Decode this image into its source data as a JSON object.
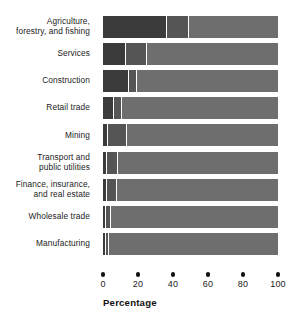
{
  "chart_data": {
    "type": "bar",
    "orientation": "horizontal",
    "stacked": true,
    "title": "",
    "xlabel": "Percentage",
    "ylabel": "",
    "xlim": [
      0,
      100
    ],
    "xticks": [
      0,
      20,
      40,
      60,
      80,
      100
    ],
    "xtick_labels": [
      "0",
      "20",
      "40",
      "60",
      "80",
      "100"
    ],
    "grid": false,
    "legend": "none",
    "categories": [
      "Agriculture, forestry, and fishing",
      "Services",
      "Construction",
      "Retail trade",
      "Mining",
      "Transport and public utilities",
      "Finance, insurance, and real estate",
      "Wholesale trade",
      "Manufacturing"
    ],
    "category_lines": [
      [
        "Agriculture,",
        "forestry, and fishing"
      ],
      [
        "Services"
      ],
      [
        "Construction"
      ],
      [
        "Retail trade"
      ],
      [
        "Mining"
      ],
      [
        "Transport and",
        "public utilities"
      ],
      [
        "Finance, insurance,",
        "and real estate"
      ],
      [
        "Wholesale trade"
      ],
      [
        "Manufacturing"
      ]
    ],
    "series": [
      {
        "name": "segment-1",
        "color": "#3b3b3b",
        "values": [
          36,
          12.5,
          14.5,
          5.7,
          2.0,
          1.6,
          1.6,
          1.3,
          1.0
        ]
      },
      {
        "name": "segment-2",
        "color": "#555555",
        "values": [
          12,
          11.5,
          3.5,
          4.0,
          10.5,
          5.9,
          5.4,
          2.2,
          1.0
        ]
      },
      {
        "name": "segment-3",
        "color": "#6e6e6e",
        "values": [
          52,
          76,
          82,
          90.3,
          87.5,
          92.5,
          93,
          96.5,
          98
        ]
      }
    ],
    "colors": {
      "segment_1": "#3b3b3b",
      "segment_2": "#555555",
      "segment_3": "#6e6e6e",
      "background": "#ffffff",
      "text": "#1b1b1b",
      "tick_dot": "#111111"
    }
  }
}
